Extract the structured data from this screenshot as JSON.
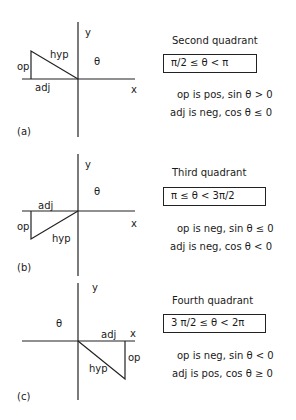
{
  "panels": [
    {
      "id": "a",
      "label": "(a)",
      "axis_labels": {
        "x": "x",
        "y": "y",
        "angle": "θ"
      },
      "side_labels": {
        "op": "op",
        "hyp": "hyp",
        "adj": "adj"
      },
      "quadrant_title": "Second quadrant",
      "range": "π/2 ≤ θ < π",
      "op_condition": "op is pos, sin θ > 0",
      "adj_condition": "adj is neg, cos θ ≤ 0"
    },
    {
      "id": "b",
      "label": "(b)",
      "axis_labels": {
        "x": "x",
        "y": "y",
        "angle": "θ"
      },
      "side_labels": {
        "op": "op",
        "hyp": "hyp",
        "adj": "adj"
      },
      "quadrant_title": "Third quadrant",
      "range": "π ≤ θ < 3π/2",
      "op_condition": "op is neg, sin θ ≤ 0",
      "adj_condition": "adj is neg, cos θ < 0"
    },
    {
      "id": "c",
      "label": "(c)",
      "axis_labels": {
        "x": "x",
        "y": "y",
        "angle": "θ"
      },
      "side_labels": {
        "op": "op",
        "hyp": "hyp",
        "adj": "adj"
      },
      "quadrant_title": "Fourth quadrant",
      "range": "3 π/2 ≤ θ < 2π",
      "op_condition": "op is neg, sin θ < 0",
      "adj_condition": "adj is pos, cos θ ≥ 0"
    }
  ],
  "colors": {
    "line": "#222222",
    "background": "#ffffff"
  }
}
